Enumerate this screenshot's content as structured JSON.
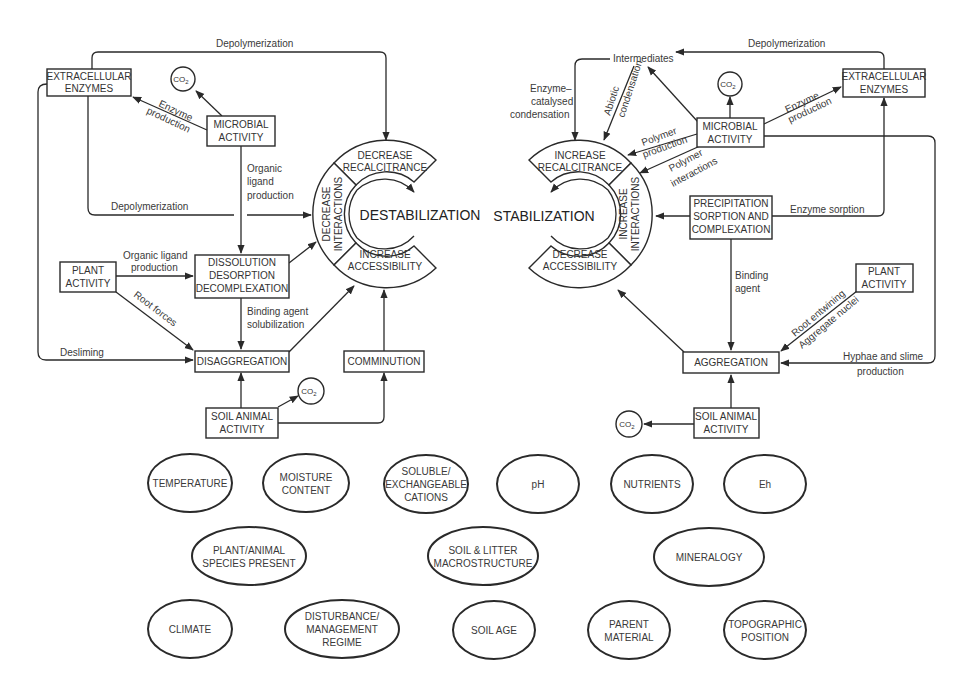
{
  "diagram": {
    "left": {
      "center_label": "DESTABILIZATION",
      "ring": {
        "top": [
          "DECREASE",
          "RECALCITRANCE"
        ],
        "side": [
          "DECREASE",
          "INTERACTIONS"
        ],
        "bottom": [
          "INCREASE",
          "ACCESSIBILITY"
        ]
      },
      "nodes": {
        "extracellular_enzymes": [
          "EXTRACELLULAR",
          "ENZYMES"
        ],
        "co2_top": "CO",
        "microbial_activity": [
          "MICROBIAL",
          "ACTIVITY"
        ],
        "plant_activity": [
          "PLANT",
          "ACTIVITY"
        ],
        "dissolution": [
          "DISSOLUTION",
          "DESORPTION",
          "DECOMPLEXATION"
        ],
        "disaggregation": "DISAGGREGATION",
        "comminution": "COMMINUTION",
        "soil_animal_activity": [
          "SOIL ANIMAL",
          "ACTIVITY"
        ],
        "co2_bottom": "CO"
      },
      "edge_labels": {
        "depolymerization_top": "Depolymerization",
        "enzyme_production": [
          "Enzyme",
          "production"
        ],
        "organic_ligand_production_vertical": [
          "Organic",
          "ligand",
          "production"
        ],
        "depolymerization_mid": "Depolymerization",
        "organic_ligand_production_plant": [
          "Organic ligand",
          "production"
        ],
        "root_forces": "Root forces",
        "binding_agent_solubilization": [
          "Binding agent",
          "solubilization"
        ],
        "desliming": "Desliming"
      }
    },
    "right": {
      "center_label": "STABILIZATION",
      "ring": {
        "top": [
          "INCREASE",
          "RECALCITRANCE"
        ],
        "side": [
          "INCREASE",
          "INTERACTIONS"
        ],
        "bottom": [
          "DECREASE",
          "ACCESSIBILITY"
        ]
      },
      "nodes": {
        "intermediates": "Intermediates",
        "extracellular_enzymes": [
          "EXTRACELLULAR",
          "ENZYMES"
        ],
        "co2_top": "CO",
        "microbial_activity": [
          "MICROBIAL",
          "ACTIVITY"
        ],
        "precipitation": [
          "PRECIPITATION",
          "SORPTION AND",
          "COMPLEXATION"
        ],
        "plant_activity": [
          "PLANT",
          "ACTIVITY"
        ],
        "aggregation": "AGGREGATION",
        "soil_animal_activity": [
          "SOIL ANIMAL",
          "ACTIVITY"
        ],
        "co2_bottom": "CO"
      },
      "edge_labels": {
        "depolymerization_top": "Depolymerization",
        "enzyme_catalysed_condensation": [
          "Enzyme–",
          "catalysed",
          "condensation"
        ],
        "abiotic_condensation": [
          "Abiotic",
          "condensation"
        ],
        "enzyme_production": [
          "Enzyme",
          "production"
        ],
        "polymer_production": [
          "Polymer",
          "production"
        ],
        "polymer_interactions": [
          "Polymer",
          "interactions"
        ],
        "enzyme_sorption": "Enzyme sorption",
        "binding_agent": [
          "Binding",
          "agent"
        ],
        "root_entwining": "Root entwining",
        "aggregate_nuclei": "Aggregate nuclei",
        "hyphae_slime": [
          "Hyphae and slime",
          "production"
        ]
      }
    },
    "co2_subscript": "2",
    "factors": [
      {
        "lines": [
          "TEMPERATURE"
        ]
      },
      {
        "lines": [
          "MOISTURE",
          "CONTENT"
        ]
      },
      {
        "lines": [
          "SOLUBLE/",
          "EXCHANGEABLE",
          "CATIONS"
        ]
      },
      {
        "lines": [
          "pH"
        ]
      },
      {
        "lines": [
          "NUTRIENTS"
        ]
      },
      {
        "lines": [
          "Eh"
        ]
      },
      {
        "lines": [
          "PLANT/ANIMAL",
          "SPECIES PRESENT"
        ]
      },
      {
        "lines": [
          "SOIL & LITTER",
          "MACROSTRUCTURE"
        ]
      },
      {
        "lines": [
          "MINERALOGY"
        ]
      },
      {
        "lines": [
          "CLIMATE"
        ]
      },
      {
        "lines": [
          "DISTURBANCE/",
          "MANAGEMENT",
          "REGIME"
        ]
      },
      {
        "lines": [
          "SOIL AGE"
        ]
      },
      {
        "lines": [
          "PARENT",
          "MATERIAL"
        ]
      },
      {
        "lines": [
          "TOPOGRAPHIC",
          "POSITION"
        ]
      }
    ],
    "colors": {
      "stroke": "#2a2a2a",
      "text": "#3a3a3a",
      "background": "#ffffff"
    }
  }
}
